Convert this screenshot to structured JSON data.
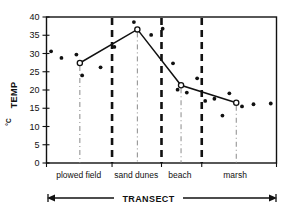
{
  "chart_data": {
    "type": "scatter",
    "title": "",
    "subtitle": "",
    "xlabel": "TRANSECT",
    "ylabel": "TEMP °C",
    "ylabel_main": "TEMP",
    "ylabel_unit": "°C",
    "ylim": [
      0,
      40
    ],
    "yticks": [
      0,
      5,
      10,
      15,
      20,
      25,
      30,
      35,
      40
    ],
    "ytick_labels": [
      "0",
      "5",
      "10",
      "15",
      "20",
      "25",
      "30",
      "35",
      "40"
    ],
    "grid": false,
    "legend": "none",
    "xlim": [
      0,
      100
    ],
    "x_axis_type": "transect distance (unlabeled)",
    "zones": [
      {
        "label": "plowed field",
        "start": 0,
        "end": 28.5,
        "label_center": 14
      },
      {
        "label": "sand dunes",
        "start": 28.5,
        "end": 50.0,
        "label_center": 39
      },
      {
        "label": "beach",
        "start": 50.0,
        "end": 67.5,
        "label_center": 58
      },
      {
        "label": "marsh",
        "start": 67.5,
        "end": 100,
        "label_center": 82
      }
    ],
    "zone_boundaries": [
      28.5,
      50.0,
      67.5
    ],
    "site_marker_x": [
      14.5,
      39.5,
      58.5,
      82.5
    ],
    "series": [
      {
        "name": "zone mean temperature",
        "marker": "open-circle",
        "connected": true,
        "points": [
          {
            "zone": "plowed field",
            "x": 14.5,
            "y": 27.4
          },
          {
            "zone": "sand dunes",
            "x": 39.5,
            "y": 36.6
          },
          {
            "zone": "beach",
            "x": 58.5,
            "y": 21.3
          },
          {
            "zone": "marsh",
            "x": 82.5,
            "y": 16.5
          }
        ]
      },
      {
        "name": "individual temperature readings",
        "marker": "filled-dot",
        "connected": false,
        "points": [
          {
            "x": 2.0,
            "y": 30.6
          },
          {
            "x": 6.5,
            "y": 28.8
          },
          {
            "x": 13.0,
            "y": 29.7
          },
          {
            "x": 15.5,
            "y": 24.0
          },
          {
            "x": 23.5,
            "y": 26.2
          },
          {
            "x": 29.5,
            "y": 31.8
          },
          {
            "x": 38.0,
            "y": 38.6
          },
          {
            "x": 45.5,
            "y": 35.1
          },
          {
            "x": 50.5,
            "y": 36.8
          },
          {
            "x": 55.0,
            "y": 27.3
          },
          {
            "x": 57.0,
            "y": 20.1
          },
          {
            "x": 61.0,
            "y": 19.3
          },
          {
            "x": 65.5,
            "y": 23.2
          },
          {
            "x": 69.0,
            "y": 17.0
          },
          {
            "x": 73.0,
            "y": 17.6
          },
          {
            "x": 76.5,
            "y": 13.0
          },
          {
            "x": 79.5,
            "y": 19.1
          },
          {
            "x": 85.0,
            "y": 15.5
          },
          {
            "x": 90.0,
            "y": 16.1
          },
          {
            "x": 97.5,
            "y": 16.3
          }
        ]
      }
    ]
  }
}
